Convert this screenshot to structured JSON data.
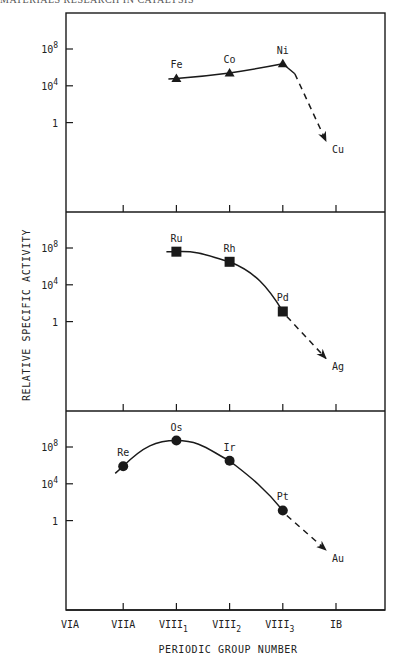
{
  "page": {
    "header": "MATERIALS RESEARCH IN CATALYSIS",
    "ylabel": "RELATIVE SPECIFIC ACTIVITY",
    "xlabel": "PERIODIC GROUP NUMBER"
  },
  "chart_data": {
    "type": "line",
    "title": "",
    "xlabel": "PERIODIC GROUP NUMBER",
    "ylabel": "RELATIVE SPECIFIC ACTIVITY",
    "y_scale": "log",
    "categories": [
      "VIA",
      "VIIA",
      "VIII1",
      "VIII2",
      "VIII3",
      "IB"
    ],
    "category_display": [
      {
        "main": "VIA",
        "sub": ""
      },
      {
        "main": "VIIA",
        "sub": ""
      },
      {
        "main": "VIII",
        "sub": "1"
      },
      {
        "main": "VIII",
        "sub": "2"
      },
      {
        "main": "VIII",
        "sub": "3"
      },
      {
        "main": "IB",
        "sub": ""
      }
    ],
    "yticks": [
      {
        "label": "10",
        "exp": "8",
        "value": 100000000.0
      },
      {
        "label": "10",
        "exp": "4",
        "value": 10000.0
      },
      {
        "label": "1",
        "exp": "",
        "value": 1
      }
    ],
    "panels": [
      {
        "name": "first-row-transition-metals",
        "marker": "triangle",
        "points": [
          {
            "element": "Fe",
            "group": "VIII1",
            "log10_activity": 4.8
          },
          {
            "element": "Co",
            "group": "VIII2",
            "log10_activity": 5.4
          },
          {
            "element": "Ni",
            "group": "VIII3",
            "log10_activity": 6.4
          }
        ],
        "extrapolated": {
          "element": "Cu",
          "group": "IB",
          "log10_activity": -2.0
        }
      },
      {
        "name": "second-row-transition-metals",
        "marker": "square",
        "points": [
          {
            "element": "Ru",
            "group": "VIII1",
            "log10_activity": 7.6
          },
          {
            "element": "Rh",
            "group": "VIII2",
            "log10_activity": 6.5
          },
          {
            "element": "Pd",
            "group": "VIII3",
            "log10_activity": 1.1
          }
        ],
        "extrapolated": {
          "element": "Ag",
          "group": "IB",
          "log10_activity": -4.0
        }
      },
      {
        "name": "third-row-transition-metals",
        "marker": "circle",
        "points": [
          {
            "element": "Re",
            "group": "VIIA",
            "log10_activity": 5.9
          },
          {
            "element": "Os",
            "group": "VIII1",
            "log10_activity": 8.7
          },
          {
            "element": "Ir",
            "group": "VIII2",
            "log10_activity": 6.5
          },
          {
            "element": "Pt",
            "group": "VIII3",
            "log10_activity": 1.1
          }
        ],
        "extrapolated": {
          "element": "Au",
          "group": "IB",
          "log10_activity": -3.2
        }
      }
    ]
  }
}
